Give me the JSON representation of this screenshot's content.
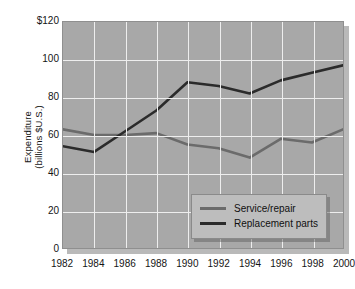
{
  "chart_data": {
    "type": "line",
    "title": "",
    "xlabel": "",
    "ylabel": "Expenditure\n(billions $U.S.)",
    "ylabel_line1": "Expenditure",
    "ylabel_line2": "(billions $U.S.)",
    "x": [
      1982,
      1984,
      1986,
      1988,
      1990,
      1992,
      1994,
      1996,
      1998,
      2000
    ],
    "categories": [
      "1982",
      "1984",
      "1986",
      "1988",
      "1990",
      "1992",
      "1994",
      "1996",
      "1998",
      "2000"
    ],
    "series": [
      {
        "name": "Service/repair",
        "color": "#6b6b6b",
        "values": [
          63,
          60,
          60,
          61,
          55,
          53,
          48,
          58,
          56,
          63
        ]
      },
      {
        "name": "Replacement parts",
        "color": "#2b2b2b",
        "values": [
          54,
          51,
          62,
          73,
          88,
          86,
          82,
          89,
          93,
          97
        ]
      }
    ],
    "ylim": [
      0,
      120
    ],
    "yticks": [
      0,
      20,
      40,
      60,
      80,
      100,
      120
    ],
    "ytick_labels": [
      "0",
      "20",
      "40",
      "60",
      "80",
      "100",
      "$120"
    ],
    "xlim": [
      1982,
      2000
    ],
    "grid": true,
    "legend_position": "bottom-right",
    "plot_background": "#a8a8a8",
    "grid_color": "#eeeeee"
  },
  "legend": {
    "entries": [
      {
        "label": "Service/repair"
      },
      {
        "label": "Replacement parts"
      }
    ]
  }
}
